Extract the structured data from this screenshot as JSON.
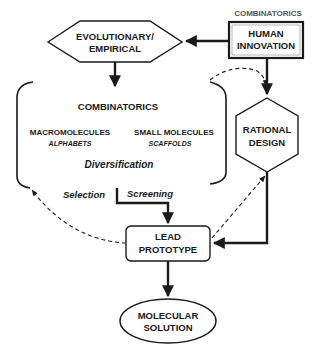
{
  "diagram": {
    "top_label": "COMBINATORICS",
    "human_innovation": {
      "line1": "HUMAN",
      "line2": "INNOVATION"
    },
    "evolutionary": {
      "line1": "EVOLUTIONARY/",
      "line2": "EMPIRICAL"
    },
    "combinatorics_group": {
      "title": "COMBINATORICS",
      "left": {
        "title": "MACROMOLECULES",
        "sub": "ALPHABETS"
      },
      "right": {
        "title": "SMALL MOLECULES",
        "sub": "SCAFFOLDS"
      },
      "process": "Diversification"
    },
    "selection_label": "Selection",
    "screening_label": "Screening",
    "rational_design": {
      "line1": "RATIONAL",
      "line2": "DESIGN"
    },
    "lead_prototype": {
      "line1": "LEAD",
      "line2": "PROTOTYPE"
    },
    "molecular_solution": {
      "line1": "MOLECULAR",
      "line2": "SOLUTION"
    }
  }
}
